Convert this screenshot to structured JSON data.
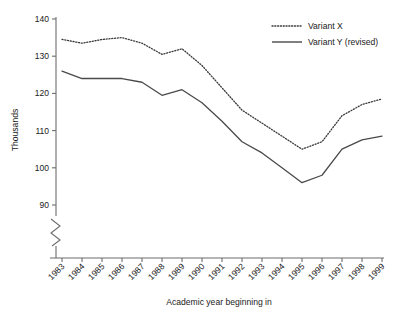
{
  "chart_data": {
    "type": "line",
    "title": "",
    "xlabel": "Academic year beginning in",
    "ylabel": "Thousands",
    "x": [
      "1983",
      "1984",
      "1985",
      "1986",
      "1987",
      "1988",
      "1989",
      "1990",
      "1991",
      "1992",
      "1993",
      "1994",
      "1995",
      "1996",
      "1997",
      "1998",
      "1999"
    ],
    "categories": [
      "1983",
      "1984",
      "1985",
      "1986",
      "1987",
      "1988",
      "1989",
      "1990",
      "1991",
      "1992",
      "1993",
      "1994",
      "1995",
      "1996",
      "1997",
      "1998",
      "1999"
    ],
    "ylim": [
      90,
      140
    ],
    "yticks": [
      90,
      100,
      110,
      120,
      130,
      140
    ],
    "ytick_labels": [
      "90",
      "100",
      "110",
      "120",
      "130",
      "140"
    ],
    "axis_break": true,
    "grid": false,
    "legend_position": "top-right",
    "series": [
      {
        "name": "Variant X",
        "style": "dotted",
        "color": "#3a3a3a",
        "values": [
          134.5,
          133.5,
          134.5,
          135.0,
          133.5,
          130.5,
          132.0,
          127.5,
          121.5,
          115.5,
          112.0,
          108.5,
          105.0,
          107.0,
          114.0,
          117.0,
          118.5
        ]
      },
      {
        "name": "Variant Y (revised)",
        "style": "solid",
        "color": "#4a4a4a",
        "values": [
          126.0,
          124.0,
          124.0,
          124.0,
          123.0,
          119.5,
          121.0,
          117.5,
          112.5,
          107.0,
          104.0,
          100.0,
          96.0,
          98.0,
          105.0,
          107.5,
          108.5
        ]
      }
    ]
  },
  "legend": {
    "items": [
      {
        "label": "Variant X"
      },
      {
        "label": "Variant Y (revised)"
      }
    ]
  },
  "axes": {
    "y_title": "Thousands",
    "x_title": "Academic year beginning in"
  }
}
